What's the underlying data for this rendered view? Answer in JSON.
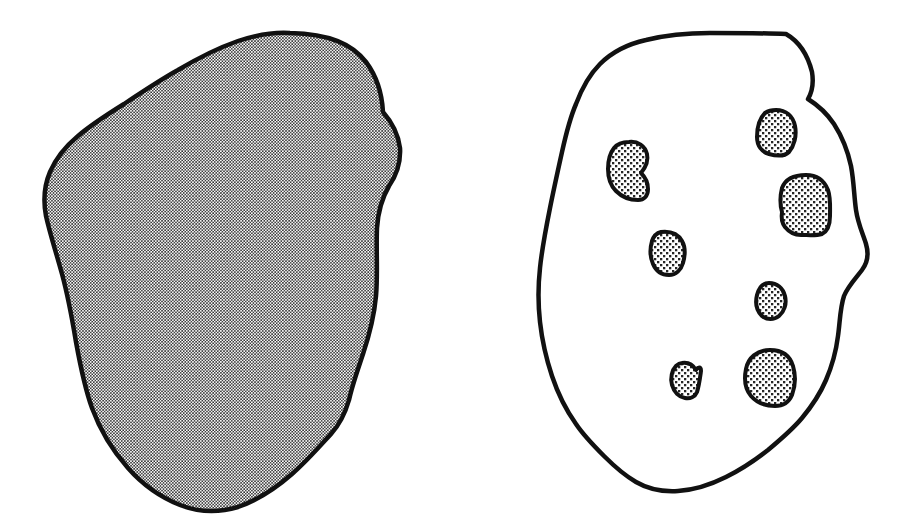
{
  "figure": {
    "width": 904,
    "height": 527,
    "background_color": "#ffffff",
    "ink_color": "#111111",
    "caption": "",
    "title": ""
  },
  "panels": [
    {
      "id": "left-panel",
      "name": "uniformly-stippled-blob",
      "label": "",
      "outline_color": "#111111",
      "outline_width": 4.5,
      "fill_pattern": "fine-halftone-dots",
      "fill_tone": "#9a9a9a",
      "bounds": {
        "x": 42,
        "y": 31,
        "width": 360,
        "height": 481
      },
      "inclusion_count": 0,
      "path": "M 290 33 C 330 34 352 44 366 62 C 378 78 382 94 383 112 C 390 120 398 132 400 148 C 401 164 396 176 389 186 C 382 198 378 212 377 228 C 376 250 378 274 376 296 C 374 318 369 336 363 354 C 357 372 352 386 349 400 C 345 414 340 424 331 434 C 320 446 306 462 292 474 C 276 488 258 500 238 507 C 218 513 198 512 180 505 C 160 497 142 484 128 468 C 112 450 100 430 92 408 C 84 386 80 364 76 342 C 72 318 68 296 62 274 C 56 252 50 234 46 216 C 43 200 44 186 50 172 C 56 158 66 146 78 136 C 92 124 108 114 124 104 C 142 92 160 80 178 70 C 198 58 218 48 238 41 C 256 35 274 32 290 33 Z"
    },
    {
      "id": "right-panel",
      "name": "blob-with-inclusions",
      "label": "",
      "outline_color": "#111111",
      "outline_width": 4.5,
      "fill_pattern": "none",
      "fill_tone": "#ffffff",
      "bounds": {
        "x": 540,
        "y": 33,
        "width": 330,
        "height": 460
      },
      "inclusion_count": 7,
      "path": "M 786 34 C 800 42 808 56 812 72 C 814 84 812 92 808 99 C 816 104 826 112 834 124 C 843 138 848 152 851 166 C 854 182 854 196 856 210 C 858 224 863 234 866 244 C 869 254 868 262 862 270 C 856 278 848 286 844 296 C 840 308 840 322 838 336 C 836 352 832 366 826 380 C 820 394 812 406 802 418 C 792 430 780 440 768 450 C 754 461 740 470 726 477 C 710 485 694 490 678 491 C 662 492 648 489 636 482 C 624 475 614 466 604 456 C 594 446 584 436 576 424 C 566 410 558 394 552 376 C 546 358 542 340 540 322 C 538 304 538 286 540 268 C 542 248 546 228 550 208 C 554 188 558 170 562 152 C 566 134 570 118 576 104 C 582 88 590 74 600 64 C 612 52 628 44 646 40 C 666 35 688 33 710 33 C 736 33 762 33 786 34 Z",
      "inclusions": [
        {
          "id": "inclusion-1",
          "name": "inclusion-kidney-upper-left",
          "shape": "kidney",
          "centroid": {
            "x": 628,
            "y": 171
          },
          "size": {
            "width": 40,
            "height": 58
          },
          "path": "M 629 142 C 638 141 645 146 647 154 C 649 162 645 168 641 173 C 645 177 648 182 648 189 C 648 196 644 200 638 200 C 630 200 622 197 616 191 C 610 185 608 177 608 169 C 608 161 610 153 614 148 C 618 143 623 142 629 142 Z"
        },
        {
          "id": "inclusion-2",
          "name": "inclusion-upper-right",
          "shape": "rounded-polygon",
          "centroid": {
            "x": 776,
            "y": 132
          },
          "size": {
            "width": 38,
            "height": 45
          },
          "path": "M 776 110 C 786 110 793 116 795 126 C 797 136 794 146 789 152 C 784 157 776 156 769 154 C 762 152 757 146 757 137 C 757 127 760 118 765 113 C 768 111 772 110 776 110 Z"
        },
        {
          "id": "inclusion-3",
          "name": "inclusion-large-right",
          "shape": "rounded-polygon",
          "centroid": {
            "x": 805,
            "y": 205
          },
          "size": {
            "width": 50,
            "height": 61
          },
          "path": "M 806 175 C 817 175 824 180 828 190 C 831 199 830 208 830 216 C 830 224 828 231 822 234 C 816 236 808 235 801 235 C 794 235 789 232 785 227 C 782 223 781 218 782 212 C 780 205 780 196 782 188 C 785 180 793 175 806 175 Z"
        },
        {
          "id": "inclusion-4",
          "name": "inclusion-center",
          "shape": "teardrop",
          "centroid": {
            "x": 667,
            "y": 253
          },
          "size": {
            "width": 35,
            "height": 43
          },
          "path": "M 661 232 C 670 231 678 234 682 241 C 686 248 685 256 683 263 C 681 270 676 275 669 275 C 662 275 656 271 653 264 C 650 257 650 248 652 241 C 654 235 657 233 661 232 Z"
        },
        {
          "id": "inclusion-5",
          "name": "inclusion-mid-right",
          "shape": "oval",
          "centroid": {
            "x": 770,
            "y": 301
          },
          "size": {
            "width": 30,
            "height": 37
          },
          "path": "M 769 283 C 777 283 783 288 785 296 C 787 304 784 312 779 316 C 774 320 767 320 762 316 C 757 311 755 303 757 295 C 759 287 763 283 769 283 Z"
        },
        {
          "id": "inclusion-6",
          "name": "inclusion-lower-left-small",
          "shape": "notched-oval",
          "centroid": {
            "x": 686,
            "y": 380
          },
          "size": {
            "width": 28,
            "height": 35
          },
          "path": "M 682 363 C 688 362 693 365 696 370 C 698 367 701 366 701 371 C 700 378 699 386 697 392 C 695 397 690 399 685 398 C 679 397 674 392 672 385 C 670 378 672 370 676 366 C 678 364 680 363 682 363 Z"
        },
        {
          "id": "inclusion-7",
          "name": "inclusion-lower-right",
          "shape": "rounded-polygon",
          "centroid": {
            "x": 770,
            "y": 378
          },
          "size": {
            "width": 50,
            "height": 56
          },
          "path": "M 770 350 C 782 350 790 356 793 366 C 796 376 795 387 792 395 C 789 402 783 406 775 406 C 766 406 757 403 751 396 C 745 389 744 379 746 369 C 748 358 757 350 770 350 Z"
        }
      ]
    }
  ]
}
